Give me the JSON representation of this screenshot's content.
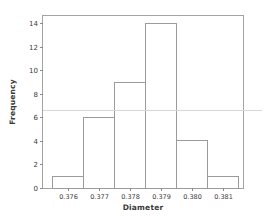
{
  "chart_data": {
    "type": "bar",
    "subtype": "histogram",
    "title": "",
    "xlabel": "Diameter",
    "ylabel": "Frequency",
    "categories": [
      "0.376",
      "0.377",
      "0.378",
      "0.379",
      "0.380",
      "0.381"
    ],
    "values": [
      1,
      6,
      9,
      14,
      4,
      1
    ],
    "bin_width": 0.001,
    "total_count": 35,
    "y_ticks": [
      0,
      2,
      4,
      6,
      8,
      10,
      12,
      14
    ],
    "ylim": [
      0,
      14.7
    ],
    "grid": false,
    "legend": "none",
    "reference_line": {
      "value": 6.6,
      "color": "#d6d6d6",
      "extends_past_right_border": true
    },
    "colors": {
      "bar_fill": "#ffffff",
      "bar_stroke": "#9b9b9b",
      "axis_color": "#a3a3a3",
      "tick_color": "#8a8a8a",
      "text_color": "#3a3a3a",
      "background": "#ffffff"
    }
  }
}
